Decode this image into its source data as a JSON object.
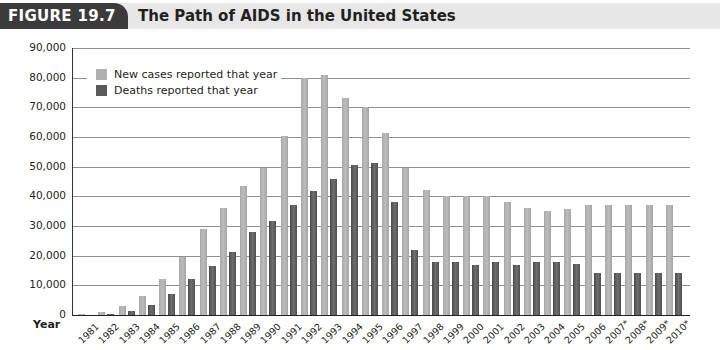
{
  "figure": {
    "label": "FIGURE 19.7",
    "title": "The Path of AIDS in the United States"
  },
  "axis": {
    "x_label": "Year",
    "y_ticks": [
      "0",
      "10,000",
      "20,000",
      "30,000",
      "40,000",
      "50,000",
      "60,000",
      "70,000",
      "80,000",
      "90,000"
    ]
  },
  "legend": {
    "new_cases": "New cases reported that year",
    "deaths": "Deaths reported that year"
  },
  "colors": {
    "new_cases": "#b0b0b0",
    "deaths": "#5a5a5a",
    "title_bar": "#e7e7e7",
    "figure_label_bg": "#3b3b3b"
  },
  "chart_data": {
    "type": "bar",
    "title": "The Path of AIDS in the United States",
    "xlabel": "Year",
    "ylabel": "",
    "ylim": [
      0,
      90000
    ],
    "grid": true,
    "legend_position": "upper left",
    "categories": [
      "1981",
      "1982",
      "1983",
      "1984",
      "1985",
      "1986",
      "1987",
      "1988",
      "1989",
      "1990",
      "1991",
      "1992",
      "1993",
      "1994",
      "1995",
      "1996",
      "1997",
      "1998",
      "1999",
      "2000",
      "2001",
      "2002",
      "2003",
      "2004",
      "2005",
      "2006",
      "2007*",
      "2008*",
      "2009*",
      "2010*"
    ],
    "series": [
      {
        "name": "New cases reported that year",
        "values": [
          300,
          1100,
          3100,
          6300,
          12000,
          19400,
          29000,
          36000,
          43500,
          49700,
          60500,
          80000,
          81000,
          73300,
          70000,
          61200,
          49500,
          42000,
          40000,
          40000,
          40000,
          38000,
          36000,
          35000,
          35800,
          37000,
          37200,
          37200,
          37200,
          37200
        ]
      },
      {
        "name": "Deaths reported that year",
        "values": [
          100,
          500,
          1500,
          3500,
          7000,
          12200,
          16500,
          21200,
          27900,
          31700,
          37000,
          41800,
          45700,
          50600,
          51400,
          38000,
          21900,
          18000,
          17900,
          17000,
          17900,
          17000,
          17900,
          17900,
          17200,
          14100,
          14100,
          14100,
          14100,
          14100
        ]
      }
    ]
  }
}
